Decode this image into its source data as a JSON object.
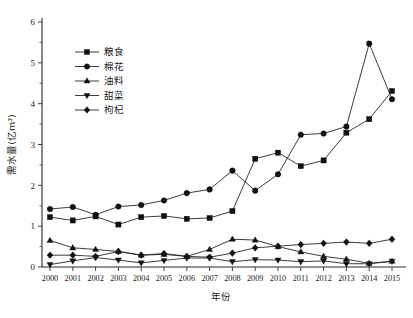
{
  "chart_data": {
    "type": "line",
    "title": "",
    "xlabel": "年份",
    "ylabel": "需水量(亿m³)",
    "xlim": [
      2000,
      2015
    ],
    "ylim": [
      0,
      6
    ],
    "yticks": [
      "0",
      "1",
      "2",
      "3",
      "4",
      "5",
      "6"
    ],
    "ytick_minor_step": 0.5,
    "grid": false,
    "legend_position": "upper-left",
    "categories": [
      "2000",
      "2001",
      "2002",
      "2003",
      "2004",
      "2005",
      "2006",
      "2007",
      "2008",
      "2009",
      "2010",
      "2011",
      "2012",
      "2013",
      "2014",
      "2015"
    ],
    "series": [
      {
        "name": "粮食",
        "marker": "square",
        "values": [
          1.22,
          1.14,
          1.24,
          1.04,
          1.22,
          1.25,
          1.18,
          1.2,
          1.37,
          2.65,
          2.8,
          2.47,
          2.61,
          3.29,
          3.62,
          4.31
        ]
      },
      {
        "name": "棉花",
        "marker": "circle",
        "values": [
          1.42,
          1.47,
          1.28,
          1.48,
          1.52,
          1.63,
          1.81,
          1.9,
          2.36,
          1.87,
          2.27,
          3.24,
          3.27,
          3.44,
          5.47,
          4.11
        ]
      },
      {
        "name": "油料",
        "marker": "triangle-up",
        "values": [
          0.65,
          0.47,
          0.43,
          0.38,
          0.29,
          0.31,
          0.26,
          0.43,
          0.68,
          0.66,
          0.5,
          0.37,
          0.26,
          0.19,
          0.09,
          0.14
        ]
      },
      {
        "name": "甜菜",
        "marker": "triangle-down",
        "values": [
          0.06,
          0.15,
          0.23,
          0.17,
          0.1,
          0.16,
          0.22,
          0.22,
          0.13,
          0.18,
          0.17,
          0.13,
          0.15,
          0.08,
          0.08,
          0.14
        ]
      },
      {
        "name": "枸杞",
        "marker": "diamond",
        "values": [
          0.29,
          0.29,
          0.26,
          0.38,
          0.29,
          0.33,
          0.26,
          0.24,
          0.34,
          0.47,
          0.51,
          0.55,
          0.58,
          0.61,
          0.58,
          0.68
        ]
      }
    ],
    "colors": {
      "axis": "#2b2b2b",
      "series": "#1a1a1a",
      "background": "#ffffff"
    }
  },
  "caption": ""
}
